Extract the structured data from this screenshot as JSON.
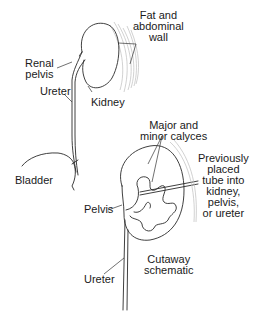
{
  "figure": {
    "labels": {
      "fat_wall": "Fat and\nabdominal\nwall",
      "renal_pelvis": "Renal\npelvis",
      "ureter_top": "Ureter",
      "kidney": "Kidney",
      "bladder": "Bladder",
      "calyces": "Major and\nminor calyces",
      "tube": "Previously\nplaced\ntube into\nkidney,\npelvis,\nor ureter",
      "pelvis": "Pelvis",
      "cutaway": "Cutaway\nschematic",
      "ureter_bottom": "Ureter"
    }
  }
}
